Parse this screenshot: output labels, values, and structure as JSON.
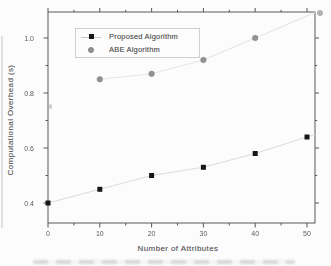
{
  "chart_data": {
    "type": "scatter",
    "title": "",
    "xlabel": "Number of Attributes",
    "ylabel": "Computational Overhead (s)",
    "xlim": [
      0,
      50
    ],
    "ylim": [
      0.4,
      1.0
    ],
    "grid": false,
    "legend_position": "top-left-inside",
    "x_ticks": [
      0,
      10,
      20,
      30,
      40,
      50
    ],
    "x_tick_labels": [
      "0",
      "10",
      "20",
      "30",
      "40",
      "50"
    ],
    "x_minor_ticks": [
      5,
      15,
      25,
      35,
      45
    ],
    "y_ticks": [
      0.4,
      0.6,
      0.8,
      1.0
    ],
    "y_tick_labels": [
      "0.4",
      "0.6",
      "0.8",
      "1.0"
    ],
    "y_minor_ticks": [
      0.5,
      0.7,
      0.9
    ],
    "series": [
      {
        "name": "Proposed Algorithm",
        "marker": "square",
        "marker_color": "#161616",
        "line_color": "#dcdcdc",
        "x": [
          0,
          10,
          20,
          30,
          40,
          50
        ],
        "values": [
          0.4,
          0.45,
          0.5,
          0.53,
          0.58,
          0.64
        ]
      },
      {
        "name": "ABE Algorithm",
        "marker": "circle",
        "marker_color": "#919191",
        "line_color": "#e5e5e5",
        "x": [
          10,
          20,
          30,
          40
        ],
        "values": [
          0.85,
          0.87,
          0.92,
          1.0
        ]
      }
    ]
  },
  "colors": {
    "background": "#fcfcfc",
    "axis": "#585858",
    "text": "#5a5a5a",
    "legend_border": "#cfcfcf"
  }
}
